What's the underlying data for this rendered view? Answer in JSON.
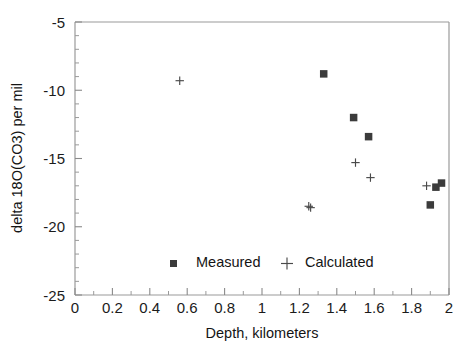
{
  "chart_data": {
    "type": "scatter",
    "title": "",
    "xlabel": "Depth,  kilometers",
    "ylabel": "delta 18O(CO3)  per mil",
    "xlim": [
      0,
      2
    ],
    "ylim": [
      -25,
      -5
    ],
    "grid": false,
    "legend_position": "inside-bottom-center",
    "x_ticks": [
      0,
      0.2,
      0.4,
      0.6,
      0.8,
      1,
      1.2,
      1.4,
      1.6,
      1.8,
      2
    ],
    "x_tick_labels": [
      "0",
      "0.2",
      "0.4",
      "0.6",
      "0.8",
      "1",
      "1.2",
      "1.4",
      "1.6",
      "1.8",
      "2"
    ],
    "x_minor_step": 0.1,
    "y_ticks": [
      -5,
      -10,
      -15,
      -20,
      -25
    ],
    "y_tick_labels": [
      "-5",
      "-10",
      "-15",
      "-20",
      "-25"
    ],
    "y_minor_step": 1,
    "series": [
      {
        "name": "Measured",
        "marker": "square",
        "color": "#3b3b3b",
        "points": [
          {
            "x": 1.33,
            "y": -8.8
          },
          {
            "x": 1.49,
            "y": -12.0
          },
          {
            "x": 1.57,
            "y": -13.4
          },
          {
            "x": 1.9,
            "y": -18.4
          },
          {
            "x": 1.93,
            "y": -17.1
          },
          {
            "x": 1.96,
            "y": -16.8
          }
        ]
      },
      {
        "name": "Calculated",
        "marker": "plus",
        "color": "#4a4a4a",
        "points": [
          {
            "x": 0.56,
            "y": -9.3
          },
          {
            "x": 1.25,
            "y": -18.5
          },
          {
            "x": 1.26,
            "y": -18.6
          },
          {
            "x": 1.5,
            "y": -15.3
          },
          {
            "x": 1.58,
            "y": -16.4
          },
          {
            "x": 1.88,
            "y": -17.0
          }
        ]
      }
    ]
  },
  "axes": {
    "x_label": "Depth,  kilometers",
    "y_label": "delta 18O(CO3)  per mil"
  },
  "legend": {
    "entries": [
      {
        "label": "Measured",
        "marker": "square"
      },
      {
        "label": "Calculated",
        "marker": "plus"
      }
    ]
  },
  "colors": {
    "marker": "#3b3b3b",
    "axis": "#9a9a9a",
    "text": "#1a1a1a",
    "background": "#ffffff"
  }
}
